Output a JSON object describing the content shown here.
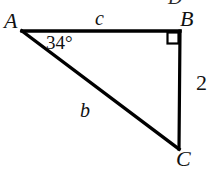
{
  "figure": {
    "type": "right-triangle-diagram",
    "background_color": "#ffffff",
    "stroke_color": "#000000",
    "stroke_width_px": 3,
    "vertices": {
      "A": {
        "label": "A",
        "x": 22,
        "y": 31
      },
      "B": {
        "label": "B",
        "x": 180,
        "y": 31
      },
      "C": {
        "label": "C",
        "x": 179,
        "y": 148
      }
    },
    "sides": {
      "AB": {
        "label": "c",
        "from": "A",
        "to": "B",
        "position": "top"
      },
      "AC": {
        "label": "b",
        "from": "A",
        "to": "C",
        "position": "hypotenuse"
      },
      "BC": {
        "label": "2",
        "from": "B",
        "to": "C",
        "position": "right"
      }
    },
    "angles": {
      "A": {
        "label": "34°",
        "value": 34,
        "unit": "degrees"
      },
      "B": {
        "label": "right-angle",
        "value": 90,
        "marker": "square"
      }
    },
    "cut_off_text_top": "D"
  }
}
